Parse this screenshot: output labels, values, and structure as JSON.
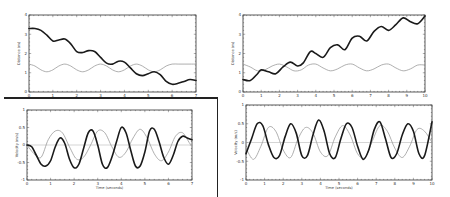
{
  "chart_data": [
    {
      "id": "top-left",
      "type": "line",
      "title": "",
      "xlabel": "Time (seconds)",
      "ylabel": "Distance (m)",
      "xlim": [
        0,
        7
      ],
      "ylim": [
        0,
        4
      ],
      "xticks": [
        0,
        1,
        2,
        3,
        4,
        5,
        6,
        7
      ],
      "yticks": [
        0,
        1,
        2,
        3,
        4
      ],
      "grid": false,
      "series": [
        {
          "name": "dark",
          "style": "thick-dark",
          "x": [
            0,
            0.25,
            0.5,
            0.75,
            1.0,
            1.25,
            1.5,
            1.75,
            2.0,
            2.25,
            2.5,
            2.75,
            3.0,
            3.25,
            3.5,
            3.75,
            4.0,
            4.25,
            4.5,
            4.75,
            5.0,
            5.25,
            5.5,
            5.75,
            6.0,
            6.25,
            6.5,
            6.75,
            7.0
          ],
          "y": [
            3.3,
            3.3,
            3.2,
            2.95,
            2.65,
            2.7,
            2.75,
            2.5,
            2.1,
            2.05,
            2.15,
            2.1,
            1.8,
            1.5,
            1.45,
            1.6,
            1.55,
            1.25,
            0.95,
            0.85,
            0.95,
            1.05,
            0.9,
            0.55,
            0.4,
            0.45,
            0.55,
            0.65,
            0.6
          ]
        },
        {
          "name": "light",
          "style": "thin-light",
          "x": [
            0,
            0.25,
            0.5,
            0.75,
            1.0,
            1.25,
            1.5,
            1.75,
            2.0,
            2.25,
            2.5,
            2.75,
            3.0,
            3.25,
            3.5,
            3.75,
            4.0,
            4.25,
            4.5,
            4.75,
            5.0,
            5.25,
            5.5,
            5.75,
            6.0,
            6.25,
            6.5,
            6.75,
            7.0
          ],
          "y": [
            1.45,
            1.35,
            1.15,
            1.05,
            1.15,
            1.35,
            1.45,
            1.35,
            1.15,
            1.05,
            1.15,
            1.35,
            1.45,
            1.35,
            1.15,
            1.05,
            1.15,
            1.35,
            1.45,
            1.35,
            1.15,
            1.05,
            1.15,
            1.35,
            1.45,
            1.45,
            1.45,
            1.45,
            1.45
          ]
        }
      ]
    },
    {
      "id": "top-right",
      "type": "line",
      "title": "",
      "xlabel": "Time (seconds)",
      "ylabel": "Distance (m)",
      "xlim": [
        0,
        10
      ],
      "ylim": [
        0,
        4
      ],
      "xticks": [
        0,
        1,
        2,
        3,
        4,
        5,
        6,
        7,
        8,
        9,
        10
      ],
      "yticks": [
        0,
        1,
        2,
        3,
        4
      ],
      "grid": false,
      "series": [
        {
          "name": "dark",
          "style": "thick-dark",
          "x": [
            0,
            0.4,
            0.8,
            1.0,
            1.4,
            1.8,
            2.2,
            2.6,
            3.0,
            3.3,
            3.7,
            4.0,
            4.4,
            4.8,
            5.2,
            5.6,
            6.0,
            6.4,
            6.8,
            7.2,
            7.6,
            8.0,
            8.4,
            8.8,
            9.2,
            9.6,
            10.0
          ],
          "y": [
            0.65,
            0.6,
            0.95,
            1.15,
            1.05,
            0.95,
            1.3,
            1.55,
            1.35,
            1.5,
            2.1,
            2.0,
            1.8,
            2.3,
            2.45,
            2.2,
            2.8,
            2.9,
            2.65,
            3.15,
            3.4,
            3.2,
            3.5,
            3.85,
            3.65,
            3.55,
            3.95
          ]
        },
        {
          "name": "light",
          "style": "thin-light",
          "x": [
            0,
            0.4,
            0.8,
            1.2,
            1.6,
            2.0,
            2.4,
            2.8,
            3.2,
            3.6,
            4.0,
            4.4,
            4.8,
            5.2,
            5.6,
            6.0,
            6.4,
            6.8,
            7.2,
            7.6,
            8.0,
            8.4,
            8.8,
            9.2,
            9.6,
            10.0
          ],
          "y": [
            1.45,
            1.3,
            1.1,
            1.15,
            1.35,
            1.45,
            1.3,
            1.1,
            1.15,
            1.4,
            1.45,
            1.25,
            1.1,
            1.2,
            1.4,
            1.45,
            1.25,
            1.1,
            1.2,
            1.4,
            1.45,
            1.25,
            1.1,
            1.2,
            1.4,
            1.4
          ]
        }
      ]
    },
    {
      "id": "bottom-left",
      "type": "line",
      "title": "",
      "xlabel": "Time (seconds)",
      "ylabel": "Velocity (m/s)",
      "xlim": [
        0,
        7
      ],
      "ylim": [
        -1,
        1
      ],
      "xticks": [
        0,
        1,
        2,
        3,
        4,
        5,
        6,
        7
      ],
      "yticks": [
        -1,
        -0.5,
        0,
        0.5,
        1
      ],
      "grid": false,
      "zero_line": true,
      "series": [
        {
          "name": "dark",
          "style": "thick-dark",
          "x": [
            0,
            0.2,
            0.4,
            0.6,
            0.8,
            1.0,
            1.2,
            1.4,
            1.6,
            1.8,
            2.0,
            2.2,
            2.4,
            2.6,
            2.8,
            3.0,
            3.2,
            3.4,
            3.6,
            3.8,
            4.0,
            4.2,
            4.4,
            4.6,
            4.8,
            5.0,
            5.2,
            5.4,
            5.6,
            5.8,
            6.0,
            6.2,
            6.4,
            6.6,
            6.8,
            7.0
          ],
          "y": [
            0.0,
            -0.05,
            -0.3,
            -0.55,
            -0.6,
            -0.45,
            -0.05,
            0.2,
            0.05,
            -0.4,
            -0.65,
            -0.55,
            -0.1,
            0.35,
            0.4,
            0.0,
            -0.55,
            -0.65,
            -0.35,
            0.1,
            0.5,
            0.35,
            -0.15,
            -0.6,
            -0.6,
            -0.2,
            0.4,
            0.45,
            0.1,
            -0.35,
            -0.55,
            -0.3,
            0.1,
            0.25,
            0.2,
            0.15
          ]
        },
        {
          "name": "light",
          "style": "thin-light",
          "x": [
            0,
            0.3,
            0.6,
            0.9,
            1.2,
            1.5,
            1.8,
            2.1,
            2.4,
            2.7,
            3.0,
            3.3,
            3.6,
            3.9,
            4.2,
            4.5,
            4.8,
            5.1,
            5.4,
            5.7,
            6.0,
            6.3,
            6.6,
            6.9,
            7.0
          ],
          "y": [
            0.0,
            -0.25,
            -0.35,
            0.15,
            0.4,
            0.35,
            -0.05,
            -0.4,
            -0.35,
            0.0,
            0.4,
            0.35,
            -0.05,
            -0.35,
            -0.2,
            0.2,
            0.45,
            0.2,
            -0.25,
            -0.45,
            -0.2,
            0.25,
            0.35,
            0.05,
            0.0
          ]
        }
      ]
    },
    {
      "id": "bottom-right",
      "type": "line",
      "title": "",
      "xlabel": "Time (seconds)",
      "ylabel": "Velocity (m/s)",
      "xlim": [
        0,
        10
      ],
      "ylim": [
        -1,
        1
      ],
      "xticks": [
        0,
        1,
        2,
        3,
        4,
        5,
        6,
        7,
        8,
        9,
        10
      ],
      "yticks": [
        -1,
        -0.5,
        0,
        0.5,
        1
      ],
      "grid": false,
      "zero_line": true,
      "series": [
        {
          "name": "dark",
          "style": "thick-dark",
          "x": [
            0,
            0.3,
            0.6,
            0.9,
            1.2,
            1.5,
            1.8,
            2.1,
            2.4,
            2.7,
            3.0,
            3.3,
            3.6,
            3.9,
            4.2,
            4.5,
            4.8,
            5.1,
            5.4,
            5.7,
            6.0,
            6.3,
            6.6,
            6.9,
            7.2,
            7.5,
            7.8,
            8.1,
            8.4,
            8.7,
            9.0,
            9.3,
            9.6,
            10.0
          ],
          "y": [
            -0.3,
            0.1,
            0.5,
            0.45,
            -0.05,
            -0.4,
            -0.35,
            0.15,
            0.5,
            0.25,
            -0.35,
            -0.35,
            0.2,
            0.6,
            0.3,
            -0.3,
            -0.4,
            0.1,
            0.5,
            0.4,
            -0.1,
            -0.45,
            -0.2,
            0.35,
            0.55,
            0.1,
            -0.4,
            -0.3,
            0.2,
            0.5,
            0.3,
            -0.3,
            -0.35,
            0.55
          ]
        },
        {
          "name": "light",
          "style": "thin-light",
          "x": [
            0,
            0.4,
            0.8,
            1.2,
            1.6,
            2.0,
            2.4,
            2.8,
            3.2,
            3.6,
            4.0,
            4.4,
            4.8,
            5.2,
            5.6,
            6.0,
            6.4,
            6.8,
            7.2,
            7.6,
            8.0,
            8.4,
            8.8,
            9.2,
            9.6,
            10.0
          ],
          "y": [
            -0.15,
            -0.45,
            -0.1,
            0.4,
            0.3,
            -0.2,
            -0.4,
            0.1,
            0.4,
            0.25,
            -0.25,
            -0.35,
            0.15,
            0.45,
            0.2,
            -0.3,
            -0.4,
            0.05,
            0.45,
            0.3,
            -0.15,
            -0.4,
            -0.1,
            0.35,
            0.3,
            0.0
          ]
        }
      ]
    }
  ],
  "styles": {
    "dark_color": "#1a1a1a",
    "light_color": "#9a9a9a",
    "frame_color": "#333333",
    "zero_line_color": "#aaaaaa"
  }
}
